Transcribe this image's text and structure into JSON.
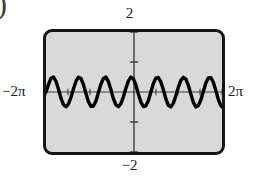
{
  "figure": {
    "stray_glyph": ")",
    "frame": {
      "fill_color": "#d9d9d9",
      "border_color": "#161616",
      "corner_radius": 9
    },
    "labels": {
      "y_max": "2",
      "y_min": "−2",
      "x_min": "−2π",
      "x_max": "2π"
    }
  },
  "chart_data": {
    "type": "line",
    "title": "",
    "subtitle": "",
    "xlabel": "",
    "ylabel": "",
    "xlim": [
      -6.283185307179586,
      6.283185307179586
    ],
    "ylim": [
      -2,
      2
    ],
    "xlim_labels": [
      "−2π",
      "2π"
    ],
    "ylim_labels": [
      "−2",
      "2"
    ],
    "grid": false,
    "legend": null,
    "axis_color": "#3c3c3c",
    "curve_color": "#000000",
    "curve_width": 3.4,
    "x_tick_spacing": 1.5707963267948966,
    "x_tick_labels": [],
    "y_tick_spacing": 1,
    "y_tick_labels": [],
    "series": [
      {
        "name": "y = 0.5 sin(3x)",
        "expression": "0.5*sin(3*x)",
        "amplitude": 0.5,
        "frequency": 3,
        "period": 2.0943951023931953,
        "phase": 0,
        "cycles_visible": 6,
        "samples_x": [
          -6.2832,
          -6.1049,
          -5.9266,
          -5.7483,
          -5.57,
          -5.3917,
          -5.2134,
          -5.0351,
          -4.8568,
          -4.6785,
          -4.5002,
          -4.3219,
          -4.1436,
          -3.9653,
          -3.787,
          -3.6087,
          -3.4304,
          -3.2521,
          -3.0738,
          -2.8955,
          -2.7172,
          -2.5389,
          -2.3606,
          -2.1823,
          -2.004,
          -1.8257,
          -1.6474,
          -1.4691,
          -1.2908,
          -1.1125,
          -0.9342,
          -0.7559,
          -0.5776,
          -0.3993,
          -0.221,
          -0.0427,
          0.1356,
          0.3139,
          0.4922,
          0.6705,
          0.8488,
          1.0271,
          1.2054,
          1.3837,
          1.562,
          1.7403,
          1.9186,
          2.0969,
          2.2752,
          2.4535,
          2.6318,
          2.8101,
          2.9884,
          3.1667,
          3.345,
          3.5233,
          3.7016,
          3.8799,
          4.0582,
          4.2365,
          4.4148,
          4.5931,
          4.7714,
          4.9497,
          5.128,
          5.3063,
          5.4846,
          5.6629,
          5.8412,
          6.0195,
          6.1978,
          6.2832
        ],
        "samples_y": [
          0.0,
          0.2541,
          0.4608,
          0.4988,
          0.3572,
          0.0895,
          -0.2076,
          -0.4232,
          -0.4926,
          -0.3997,
          -0.1762,
          0.1086,
          0.3598,
          0.4937,
          0.4507,
          0.2434,
          -0.0536,
          -0.3235,
          -0.4796,
          -0.4681,
          -0.2971,
          -0.0179,
          0.2688,
          0.4535,
          0.4968,
          0.3448,
          0.0712,
          -0.2245,
          -0.4324,
          -0.4906,
          -0.3875,
          -0.1578,
          0.1273,
          0.3719,
          0.4957,
          0.4423,
          0.2277,
          -0.0715,
          -0.3366,
          -0.4836,
          -0.4628,
          -0.2835,
          -0.0001,
          0.2833,
          0.4627,
          0.4837,
          0.3368,
          0.0717,
          -0.2275,
          -0.4422,
          -0.4957,
          -0.372,
          -0.1275,
          0.1576,
          0.3874,
          0.4906,
          0.4325,
          0.2247,
          -0.071,
          -0.3447,
          -0.4968,
          -0.4536,
          -0.269,
          0.0177,
          0.297,
          0.4681,
          0.4797,
          0.3237,
          0.0538,
          -0.2432,
          -0.4506,
          -0.4999
        ]
      }
    ]
  }
}
